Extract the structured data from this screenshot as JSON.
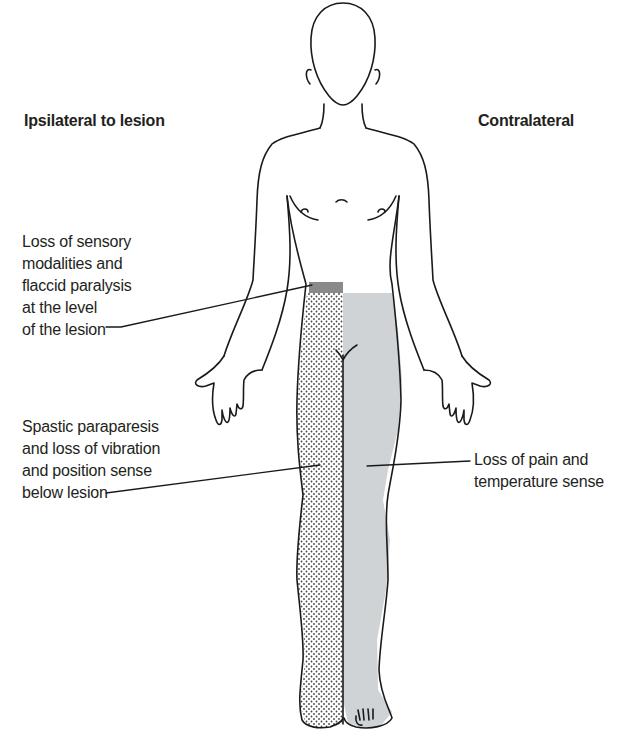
{
  "figure": {
    "headings": {
      "left": "Ipsilateral to lesion",
      "right": "Contralateral"
    },
    "annotations": [
      {
        "id": "lesion-level",
        "side": "left",
        "text": "Loss of sensory\nmodalities and\nflaccid paralysis\nat the level\nof the lesion"
      },
      {
        "id": "below-lesion-ipsilateral",
        "side": "left",
        "text": "Spastic paraparesis\nand loss of vibration\nand position sense\nbelow lesion"
      },
      {
        "id": "below-lesion-contralateral",
        "side": "right",
        "text": "Loss of pain and\ntemperature sense"
      }
    ],
    "regions": [
      {
        "name": "lesion-band",
        "pattern": "solid dark grey",
        "color": "#8a8a8a"
      },
      {
        "name": "ipsilateral-below-lesion",
        "pattern": "stippled dots",
        "color": "#555555"
      },
      {
        "name": "contralateral-below-lesion",
        "pattern": "solid light grey",
        "color": "#cfd3d6"
      }
    ]
  }
}
